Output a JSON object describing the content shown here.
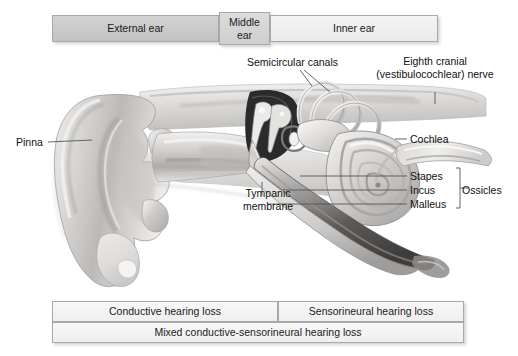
{
  "figure": {
    "background": "#ffffff"
  },
  "region_bars": {
    "top": [
      {
        "id": "external",
        "label": "External ear"
      },
      {
        "id": "middle",
        "label": "Middle ear"
      },
      {
        "id": "inner",
        "label": "Inner ear"
      }
    ],
    "bottom": [
      {
        "id": "conductive",
        "label": "Conductive hearing loss"
      },
      {
        "id": "sensorineural",
        "label": "Sensorineural hearing loss"
      },
      {
        "id": "mixed",
        "label": "Mixed conductive-sensorineural hearing loss"
      }
    ]
  },
  "callouts": {
    "semicircular_canals": "Semicircular canals",
    "eighth_nerve": "Eighth cranial (vestibulocochlear) nerve",
    "cochlea": "Cochlea",
    "pinna": "Pinna",
    "tympanic_membrane": "Tympanic membrane",
    "stapes": "Stapes",
    "incus": "Incus",
    "malleus": "Malleus",
    "ossicles": "Ossicles"
  },
  "colors": {
    "bar_border": "#a9a9a9",
    "bar_fill_dark": "#c8c8c8",
    "bar_fill_light": "#f1f1f1",
    "text": "#101010",
    "leader_line": "#555555",
    "anatomy_light": "#e8e6e4",
    "anatomy_mid": "#b9b7b5",
    "anatomy_dark": "#6e6c6a",
    "anatomy_shadow": "#3a3a3a"
  }
}
